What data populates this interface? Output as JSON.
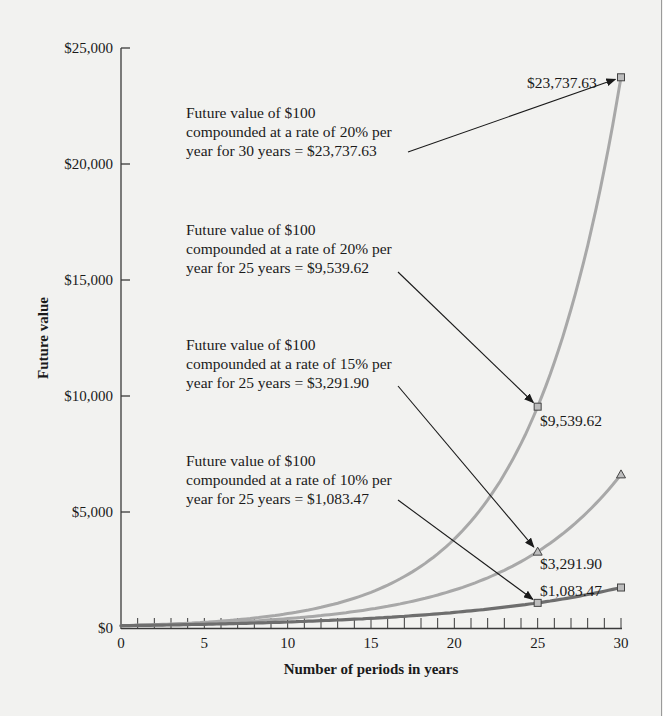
{
  "chart_data": {
    "type": "line",
    "title": "",
    "xlabel": "Number of periods in years",
    "ylabel": "Future value",
    "xlim": [
      0,
      30
    ],
    "ylim": [
      0,
      25000
    ],
    "x_ticks": [
      "0",
      "5",
      "10",
      "15",
      "20",
      "25",
      "30"
    ],
    "y_ticks": [
      "$0",
      "$5,000",
      "$10,000",
      "$15,000",
      "$20,000",
      "$25,000"
    ],
    "grid": false,
    "legend": "none",
    "principal": 100,
    "series": [
      {
        "name": "20% per year",
        "rate": 0.2,
        "color": "#a8a8a8",
        "marker": "square",
        "x": [
          0,
          5,
          10,
          15,
          20,
          25,
          30
        ],
        "values": [
          100,
          248.83,
          619.17,
          1540.7,
          3833.76,
          9539.62,
          23737.63
        ]
      },
      {
        "name": "15% per year",
        "rate": 0.15,
        "color": "#a8a8a8",
        "marker": "triangle",
        "x": [
          0,
          5,
          10,
          15,
          20,
          25,
          30
        ],
        "values": [
          100,
          201.14,
          404.56,
          813.71,
          1636.65,
          3291.9,
          6621.18
        ]
      },
      {
        "name": "10% per year",
        "rate": 0.1,
        "color": "#6e6e6e",
        "marker": "square",
        "x": [
          0,
          5,
          10,
          15,
          20,
          25,
          30
        ],
        "values": [
          100,
          161.05,
          259.37,
          417.72,
          672.75,
          1083.47,
          1744.94
        ]
      }
    ],
    "annotations": [
      {
        "lines": [
          "Future value of $100",
          "compounded at a rate of 20% per",
          "year for 30 years = $23,737.63"
        ],
        "points_to": {
          "x": 30,
          "y": 23737.63
        },
        "value_label": "$23,737.63"
      },
      {
        "lines": [
          "Future value of $100",
          "compounded at a rate of 20% per",
          "year for 25 years = $9,539.62"
        ],
        "points_to": {
          "x": 25,
          "y": 9539.62
        },
        "value_label": "$9,539.62"
      },
      {
        "lines": [
          "Future value of $100",
          "compounded at a rate of 15% per",
          "year for 25 years = $3,291.90"
        ],
        "points_to": {
          "x": 25,
          "y": 3291.9
        },
        "value_label": "$3,291.90"
      },
      {
        "lines": [
          "Future value of $100",
          "compounded at a rate of 10% per",
          "year for 25 years = $1,083.47"
        ],
        "points_to": {
          "x": 25,
          "y": 1083.47
        },
        "value_label": "$1,083.47"
      }
    ]
  }
}
